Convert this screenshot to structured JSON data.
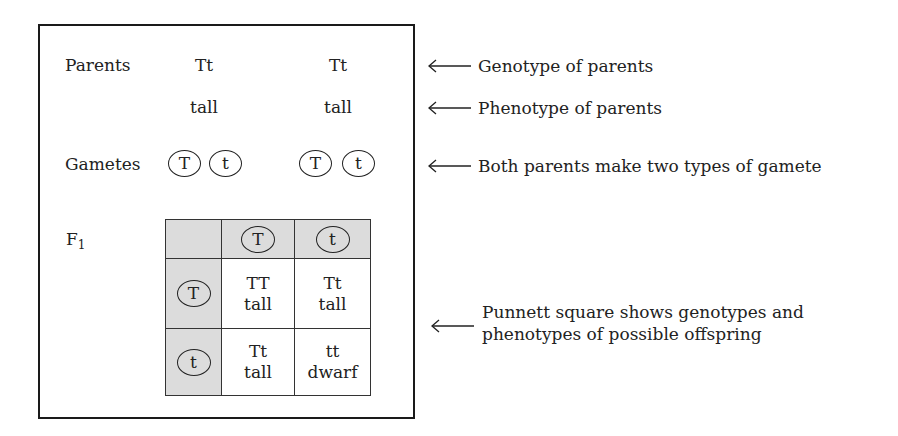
{
  "diagram": {
    "rows": {
      "parents": {
        "label": "Parents",
        "left": "Tt",
        "right": "Tt"
      },
      "phenotype": {
        "left": "tall",
        "right": "tall"
      },
      "gametes": {
        "label": "Gametes",
        "left": [
          "T",
          "t"
        ],
        "right": [
          "T",
          "t"
        ]
      },
      "f1": {
        "label": "F",
        "subscript": "1"
      }
    },
    "punnett": {
      "column_headers": [
        "T",
        "t"
      ],
      "row_headers": [
        "T",
        "t"
      ],
      "cells": [
        [
          {
            "genotype": "TT",
            "phenotype": "tall"
          },
          {
            "genotype": "Tt",
            "phenotype": "tall"
          }
        ],
        [
          {
            "genotype": "Tt",
            "phenotype": "tall"
          },
          {
            "genotype": "tt",
            "phenotype": "dwarf"
          }
        ]
      ],
      "shade_color": "#dcdcdc"
    },
    "annotations": [
      {
        "arrow": "left-arrow",
        "text": "Genotype of parents"
      },
      {
        "arrow": "left-arrow",
        "text": "Phenotype of parents"
      },
      {
        "arrow": "left-arrow",
        "text": "Both parents make two types of gamete"
      },
      {
        "arrow": "left-arrow",
        "lines": [
          "Punnett square shows genotypes and",
          "phenotypes of possible offspring"
        ]
      }
    ]
  }
}
